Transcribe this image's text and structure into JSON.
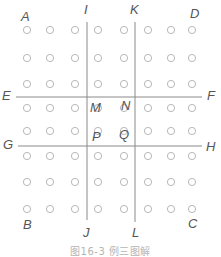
{
  "diagram": {
    "caption": "图16-3  例三图解",
    "colors": {
      "line": "#8a8a8a",
      "circle": "#b0b0b0",
      "label": "#555555",
      "caption": "#b5b5b5"
    },
    "grid": {
      "columns_x": [
        27,
        50,
        75,
        98,
        124,
        148,
        171,
        192
      ],
      "rows_y": [
        30,
        58,
        84,
        108,
        131,
        156,
        182,
        209
      ],
      "circle_radius": 3.6
    },
    "lines": [
      {
        "name": "IJ",
        "x1": 87,
        "y1": 22,
        "x2": 87,
        "y2": 220
      },
      {
        "name": "KL",
        "x1": 135,
        "y1": 22,
        "x2": 135,
        "y2": 222
      },
      {
        "name": "EF",
        "x1": 16,
        "y1": 97,
        "x2": 202,
        "y2": 97
      },
      {
        "name": "GH",
        "x1": 18,
        "y1": 146,
        "x2": 202,
        "y2": 146
      }
    ],
    "labels": [
      {
        "text": "A",
        "x": 21,
        "y": 10
      },
      {
        "text": "I",
        "x": 84,
        "y": 3
      },
      {
        "text": "K",
        "x": 130,
        "y": 3
      },
      {
        "text": "D",
        "x": 190,
        "y": 7
      },
      {
        "text": "E",
        "x": 2,
        "y": 89
      },
      {
        "text": "F",
        "x": 207,
        "y": 89
      },
      {
        "text": "M",
        "x": 90,
        "y": 101
      },
      {
        "text": "N",
        "x": 121,
        "y": 99
      },
      {
        "text": "G",
        "x": 3,
        "y": 138
      },
      {
        "text": "H",
        "x": 206,
        "y": 140
      },
      {
        "text": "P",
        "x": 92,
        "y": 130
      },
      {
        "text": "Q",
        "x": 119,
        "y": 128
      },
      {
        "text": "B",
        "x": 23,
        "y": 218
      },
      {
        "text": "C",
        "x": 188,
        "y": 217
      },
      {
        "text": "J",
        "x": 83,
        "y": 226
      },
      {
        "text": "L",
        "x": 132,
        "y": 226
      }
    ]
  }
}
